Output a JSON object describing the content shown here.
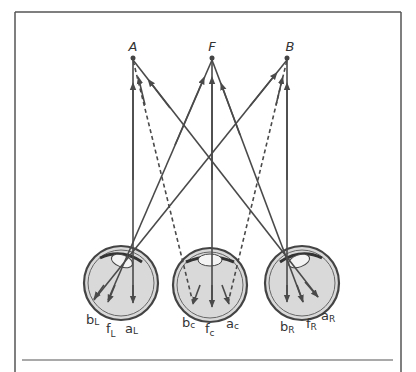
{
  "figure": {
    "points": [
      {
        "label": "A",
        "x": 133,
        "y": 58
      },
      {
        "label": "F",
        "x": 212,
        "y": 58
      },
      {
        "label": "B",
        "x": 287,
        "y": 58
      }
    ],
    "eyes": [
      {
        "id": "left",
        "cx": 121,
        "cy": 283,
        "r": 37,
        "labels": [
          {
            "base": "b",
            "sub": "L"
          },
          {
            "base": "f",
            "sub": "L"
          },
          {
            "base": "a",
            "sub": "L"
          }
        ]
      },
      {
        "id": "center",
        "cx": 210,
        "cy": 285,
        "r": 37,
        "labels": [
          {
            "base": "b",
            "sub": "c"
          },
          {
            "base": "f",
            "sub": "c"
          },
          {
            "base": "a",
            "sub": "c"
          }
        ]
      },
      {
        "id": "right",
        "cx": 302,
        "cy": 283,
        "r": 37,
        "labels": [
          {
            "base": "b",
            "sub": "R"
          },
          {
            "base": "f",
            "sub": "R"
          },
          {
            "base": "a",
            "sub": "R"
          }
        ]
      }
    ],
    "colors": {
      "line": "#4a4a4a",
      "eye_fill": "#d8d8d8",
      "frame": "#555555"
    }
  }
}
